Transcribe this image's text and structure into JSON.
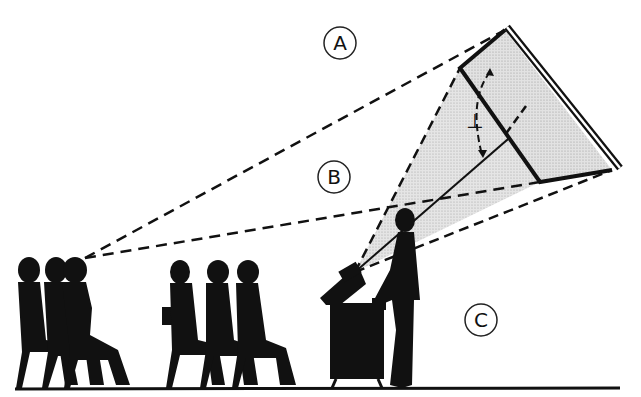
{
  "diagram": {
    "labels": [
      {
        "id": "A",
        "text": "A",
        "x": 330,
        "y": 43
      },
      {
        "id": "B",
        "text": "B",
        "x": 334,
        "y": 177
      },
      {
        "id": "C",
        "text": "C",
        "x": 481,
        "y": 320
      }
    ],
    "angle_mark": "⊥",
    "colors": {
      "ink": "#111111",
      "beam_fill": "#d9d9d9",
      "screen_fill": "#d4d4d4",
      "background": "#ffffff"
    }
  }
}
